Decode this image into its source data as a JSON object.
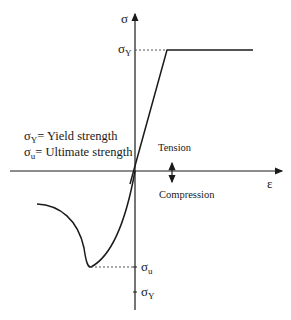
{
  "diagram": {
    "y_axis": {
      "symbol": "σ"
    },
    "x_axis": {
      "symbol": "ε"
    },
    "top_level": {
      "symbol": "σ",
      "subscript": "Y"
    },
    "ultimate_level": {
      "symbol": "σ",
      "subscript": "u"
    },
    "bottom_level": {
      "symbol": "σ",
      "subscript": "Y"
    },
    "legend": [
      {
        "symbol": "σ",
        "subscript": "Y",
        "text": "= Yield strength"
      },
      {
        "symbol": "σ",
        "subscript": "u",
        "text": "= Ultimate strength"
      }
    ],
    "direction": {
      "up": "Tension",
      "down": "Compression"
    },
    "colors": {
      "line": "#1a1a1a",
      "dashed": "#555555",
      "background": "#ffffff"
    }
  }
}
